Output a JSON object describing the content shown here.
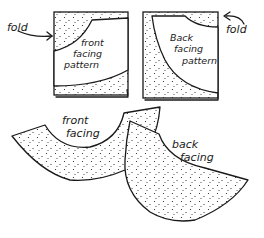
{
  "diagram": {
    "type": "sewing-illustration",
    "colors": {
      "ink": "#1a1a1a",
      "background": "#ffffff"
    },
    "panels": {
      "front_fold": {
        "fold_label": "fold",
        "pattern_label": [
          "front",
          "facing",
          "pattern"
        ]
      },
      "back_fold": {
        "fold_label": "fold",
        "pattern_label": [
          "Back",
          "facing",
          "pattern"
        ]
      }
    },
    "pieces": {
      "front_facing": {
        "label": [
          "front",
          "facing"
        ]
      },
      "back_facing": {
        "label": [
          "back",
          "facing"
        ]
      }
    }
  }
}
